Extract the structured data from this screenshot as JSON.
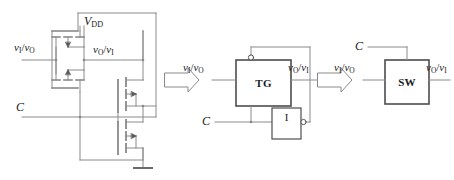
{
  "figure": {
    "line_color": "#808080",
    "box_color": "#4d4d4d",
    "text_color": "#1a1a1a",
    "background": "#ffffff"
  },
  "transistor_stage": {
    "supply_label_v": "V",
    "supply_label_sub": "DD",
    "input_label_v1": "v",
    "input_label_sub1": "I",
    "input_label_slash": "/",
    "input_label_v2": "v",
    "input_label_sub2": "O",
    "output_label_v1": "v",
    "output_label_sub1": "O",
    "output_label_slash": "/",
    "output_label_v2": "v",
    "output_label_sub2": "I",
    "control_label": "C",
    "ground_symbol": "ground-icon",
    "devices": [
      {
        "name": "pmos-top",
        "type": "PMOS"
      },
      {
        "name": "pmos-bottom",
        "type": "PMOS"
      },
      {
        "name": "nmos-upper",
        "type": "NMOS"
      },
      {
        "name": "nmos-lower",
        "type": "NMOS"
      }
    ]
  },
  "arrow_one": {
    "name": "implies-arrow-1",
    "glyph": "block-arrow-right"
  },
  "block_stage": {
    "gate_label": "TG",
    "inverter_label": "I",
    "input_label_v1": "v",
    "input_label_sub1": "I",
    "input_label_slash": "/",
    "input_label_v2": "v",
    "input_label_sub2": "O",
    "output_label_v1": "v",
    "output_label_sub1": "O",
    "output_label_slash": "/",
    "output_label_v2": "v",
    "output_label_sub2": "I",
    "control_label": "C",
    "bubble_top": "inversion-bubble",
    "bubble_inverter": "inversion-bubble"
  },
  "arrow_two": {
    "name": "implies-arrow-2",
    "glyph": "block-arrow-right"
  },
  "switch_stage": {
    "switch_label": "SW",
    "input_label_v1": "v",
    "input_label_sub1": "I",
    "input_label_slash": "/",
    "input_label_v2": "v",
    "input_label_sub2": "O",
    "output_label_v1": "v",
    "output_label_sub1": "O",
    "output_label_slash": "/",
    "output_label_v2": "v",
    "output_label_sub2": "I",
    "control_label": "C"
  }
}
